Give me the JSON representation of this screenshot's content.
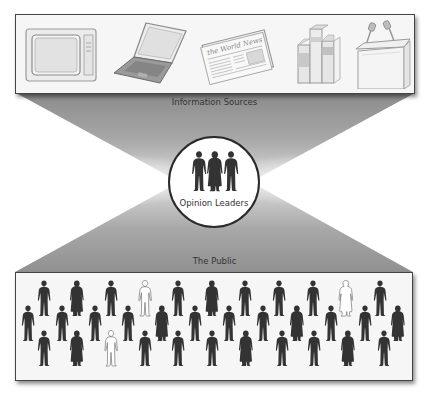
{
  "diagram": {
    "information_sources": {
      "label": "Information Sources",
      "items": [
        {
          "name": "television",
          "icon": "television-icon"
        },
        {
          "name": "laptop",
          "icon": "laptop-icon"
        },
        {
          "name": "newspaper",
          "icon": "newspaper-icon",
          "headline": "The World News"
        },
        {
          "name": "books",
          "icon": "books-icon"
        },
        {
          "name": "podium",
          "icon": "podium-icon"
        }
      ]
    },
    "opinion_leaders": {
      "label": "Opinion Leaders",
      "figures": [
        "man",
        "woman",
        "man"
      ]
    },
    "public": {
      "label": "The Public",
      "rows": [
        {
          "y": 278,
          "figures": [
            {
              "x": 44,
              "type": "man",
              "highlight": false
            },
            {
              "x": 77,
              "type": "woman",
              "highlight": false
            },
            {
              "x": 111,
              "type": "man",
              "highlight": false
            },
            {
              "x": 145,
              "type": "man",
              "highlight": true
            },
            {
              "x": 178,
              "type": "man",
              "highlight": false
            },
            {
              "x": 212,
              "type": "woman",
              "highlight": false
            },
            {
              "x": 245,
              "type": "man",
              "highlight": false
            },
            {
              "x": 279,
              "type": "man",
              "highlight": false
            },
            {
              "x": 313,
              "type": "man",
              "highlight": false
            },
            {
              "x": 346,
              "type": "woman",
              "highlight": true
            },
            {
              "x": 380,
              "type": "man",
              "highlight": false
            }
          ]
        },
        {
          "y": 303,
          "figures": [
            {
              "x": 28,
              "type": "man",
              "highlight": false
            },
            {
              "x": 62,
              "type": "man",
              "highlight": false
            },
            {
              "x": 95,
              "type": "man",
              "highlight": false
            },
            {
              "x": 128,
              "type": "man",
              "highlight": false
            },
            {
              "x": 162,
              "type": "woman",
              "highlight": false
            },
            {
              "x": 195,
              "type": "man",
              "highlight": false
            },
            {
              "x": 229,
              "type": "man",
              "highlight": false
            },
            {
              "x": 263,
              "type": "man",
              "highlight": false
            },
            {
              "x": 297,
              "type": "woman",
              "highlight": false
            },
            {
              "x": 331,
              "type": "man",
              "highlight": false
            },
            {
              "x": 365,
              "type": "man",
              "highlight": false
            },
            {
              "x": 398,
              "type": "woman",
              "highlight": false
            }
          ]
        },
        {
          "y": 328,
          "figures": [
            {
              "x": 44,
              "type": "man",
              "highlight": false
            },
            {
              "x": 77,
              "type": "woman",
              "highlight": false
            },
            {
              "x": 111,
              "type": "man",
              "highlight": true
            },
            {
              "x": 145,
              "type": "man",
              "highlight": false
            },
            {
              "x": 178,
              "type": "man",
              "highlight": false
            },
            {
              "x": 212,
              "type": "man",
              "highlight": false
            },
            {
              "x": 246,
              "type": "woman",
              "highlight": false
            },
            {
              "x": 282,
              "type": "man",
              "highlight": false
            },
            {
              "x": 314,
              "type": "man",
              "highlight": false
            },
            {
              "x": 348,
              "type": "woman",
              "highlight": false
            },
            {
              "x": 384,
              "type": "man",
              "highlight": false
            }
          ]
        }
      ]
    },
    "colors": {
      "figure_dark": "#333333",
      "figure_highlight_fill": "#ffffff",
      "figure_highlight_stroke": "#777777",
      "panel_bg": "#f6f6f6",
      "funnel_gray": "#8a8a8a",
      "border": "#444444"
    }
  }
}
